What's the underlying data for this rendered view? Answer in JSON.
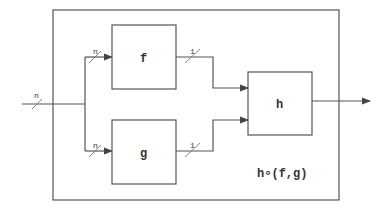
{
  "diagram": {
    "type": "block-diagram",
    "container": {
      "label": "h∘(f,g)"
    },
    "blocks": [
      {
        "id": "f",
        "label": "f"
      },
      {
        "id": "g",
        "label": "g"
      },
      {
        "id": "h",
        "label": "h"
      }
    ],
    "edges": [
      {
        "from": "input",
        "to": "split",
        "width_label": "n"
      },
      {
        "from": "split",
        "to": "f",
        "width_label": "n"
      },
      {
        "from": "split",
        "to": "g",
        "width_label": "n"
      },
      {
        "from": "f",
        "to": "h",
        "width_label": "1"
      },
      {
        "from": "g",
        "to": "h",
        "width_label": "1"
      },
      {
        "from": "h",
        "to": "output",
        "width_label": ""
      }
    ]
  }
}
